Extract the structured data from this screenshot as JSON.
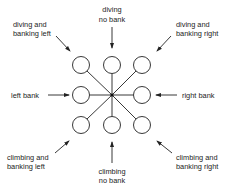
{
  "diagram": {
    "center": {
      "x": 112,
      "y": 95
    },
    "circle_radius": 8.5,
    "circles": [
      {
        "name": "upper-left",
        "x": 81,
        "y": 65
      },
      {
        "name": "upper-center",
        "x": 112,
        "y": 65
      },
      {
        "name": "upper-right",
        "x": 142,
        "y": 65
      },
      {
        "name": "middle-left",
        "x": 81,
        "y": 95
      },
      {
        "name": "middle-right",
        "x": 142,
        "y": 95
      },
      {
        "name": "lower-left",
        "x": 81,
        "y": 125
      },
      {
        "name": "lower-center",
        "x": 112,
        "y": 125
      },
      {
        "name": "lower-right",
        "x": 142,
        "y": 125
      }
    ],
    "labels": {
      "diving_no_bank": [
        "diving",
        "no bank"
      ],
      "diving_banking_left": [
        "diving and",
        "banking left"
      ],
      "diving_banking_right": [
        "diving and",
        "banking right"
      ],
      "left_bank": [
        "left bank"
      ],
      "right_bank": [
        "right bank"
      ],
      "climbing_banking_left": [
        "climbing and",
        "banking left"
      ],
      "climbing_banking_right": [
        "climbing and",
        "banking right"
      ],
      "climbing_no_bank": [
        "climbing",
        "no bank"
      ]
    },
    "colors": {
      "stroke": "#222222",
      "background": "#ffffff"
    }
  }
}
